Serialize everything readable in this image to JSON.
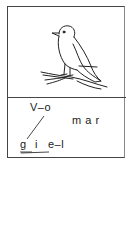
{
  "card": {
    "image": {
      "subject": "bird-on-branch",
      "icon": "bird-icon"
    },
    "puzzle": {
      "top_word": "V–o",
      "bottom_word_g": "g",
      "bottom_word_i": "i",
      "bottom_word_el": "e–l",
      "answer_word": "m a r"
    }
  }
}
